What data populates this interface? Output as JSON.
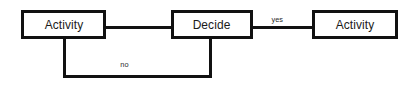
{
  "diagram": {
    "type": "flowchart",
    "background_color": "#ffffff",
    "stroke_color": "#111111",
    "text_color": "#1a1a1a",
    "nodes": [
      {
        "id": "activity-1",
        "label": "Activity",
        "shape": "rectangle"
      },
      {
        "id": "decide",
        "label": "Decide",
        "shape": "rectangle"
      },
      {
        "id": "activity-2",
        "label": "Activity",
        "shape": "rectangle"
      }
    ],
    "edges": [
      {
        "id": "a1-decide",
        "from": "activity-1",
        "to": "decide",
        "label": ""
      },
      {
        "id": "decide-a2",
        "from": "decide",
        "to": "activity-2",
        "label": "yes"
      },
      {
        "id": "decide-a1",
        "from": "decide",
        "to": "activity-1",
        "label": "no"
      }
    ],
    "edge_labels": {
      "yes": "yes",
      "no": "no"
    }
  }
}
